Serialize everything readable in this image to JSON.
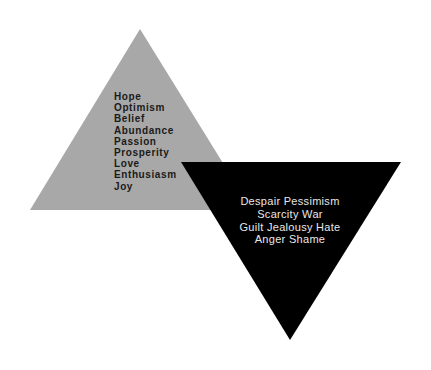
{
  "diagram": {
    "positive_triangle": {
      "color": "#a8a8a8",
      "words": [
        "Hope",
        "Optimism",
        "Belief",
        "Abundance",
        "Passion",
        "Prosperity",
        "Love",
        "Enthusiasm",
        "Joy"
      ]
    },
    "negative_triangle": {
      "color": "#000000",
      "lines": [
        "Despair Pessimism",
        "Scarcity War",
        "Guilt Jealousy Hate",
        "Anger Shame"
      ]
    }
  }
}
